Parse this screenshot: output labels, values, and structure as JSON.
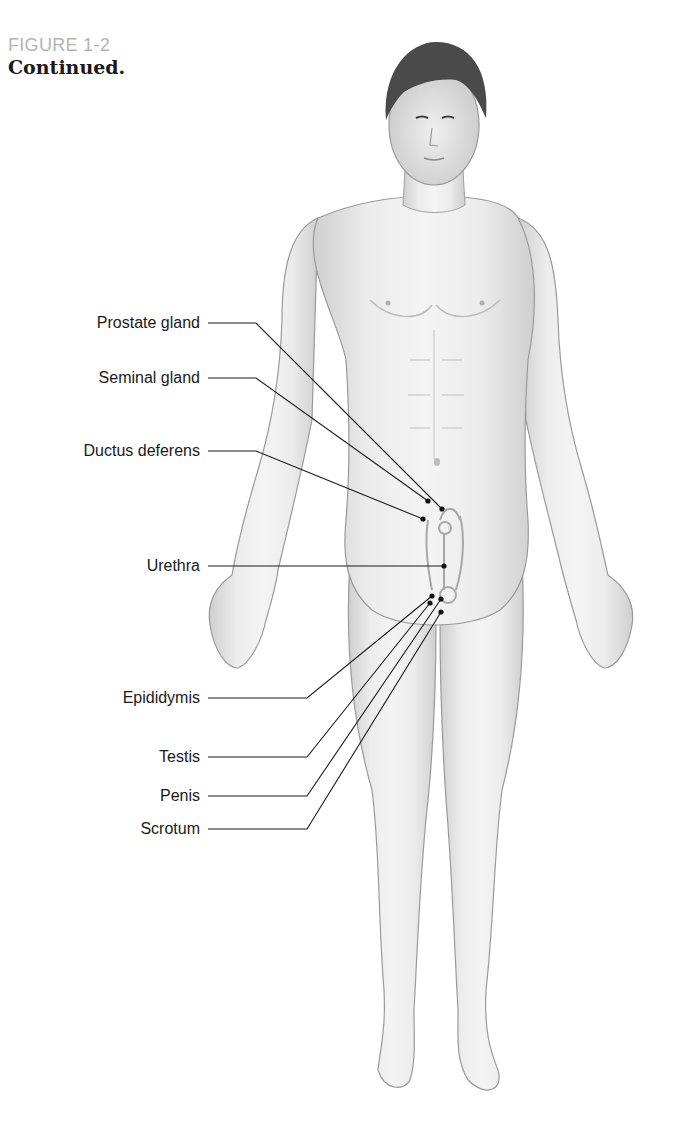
{
  "figure": {
    "number": "FIGURE 1-2",
    "caption": "Continued."
  },
  "labels": [
    {
      "id": "prostate-gland",
      "text": "Prostate gland",
      "y": 323
    },
    {
      "id": "seminal-gland",
      "text": "Seminal gland",
      "y": 378
    },
    {
      "id": "ductus-deferens",
      "text": "Ductus deferens",
      "y": 451
    },
    {
      "id": "urethra",
      "text": "Urethra",
      "y": 566
    },
    {
      "id": "epididymis",
      "text": "Epididymis",
      "y": 698
    },
    {
      "id": "testis",
      "text": "Testis",
      "y": 757
    },
    {
      "id": "penis",
      "text": "Penis",
      "y": 796
    },
    {
      "id": "scrotum",
      "text": "Scrotum",
      "y": 829
    }
  ]
}
